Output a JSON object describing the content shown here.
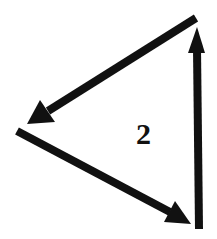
{
  "diagram": {
    "label": "2",
    "colors": {
      "stroke": "#111111",
      "background": "#ffffff"
    },
    "arrows": [
      {
        "name": "upper-left-arrow",
        "direction": "from top-right toward left vertex"
      },
      {
        "name": "lower-right-arrow",
        "direction": "from left vertex toward bottom-right"
      },
      {
        "name": "vertical-up-arrow",
        "direction": "from bottom-right upward to top-right"
      }
    ]
  }
}
